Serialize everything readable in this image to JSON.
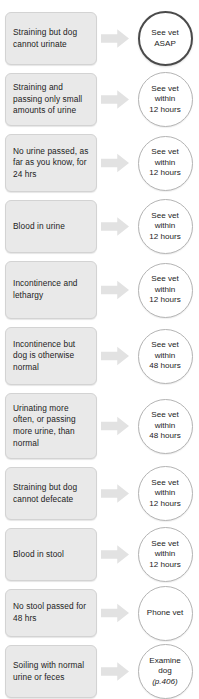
{
  "chart_data": {
    "type": "table",
    "columns": [
      "Symptom",
      "Action"
    ],
    "rows": [
      {
        "symptom": "Straining but dog cannot urinate",
        "action": "See vet ASAP",
        "urgency": "ASAP"
      },
      {
        "symptom": "Straining and passing only small amounts of urine",
        "action": "See vet within 12 hours",
        "urgency": "12 hours"
      },
      {
        "symptom": "No urine passed, as far as you know, for 24 hrs",
        "action": "See vet within 12 hours",
        "urgency": "12 hours"
      },
      {
        "symptom": "Blood in urine",
        "action": "See vet within 12 hours",
        "urgency": "12 hours"
      },
      {
        "symptom": "Incontinence and lethargy",
        "action": "See vet within 12 hours",
        "urgency": "12 hours"
      },
      {
        "symptom": "Incontinence but dog is otherwise normal",
        "action": "See vet within 48 hours",
        "urgency": "48 hours"
      },
      {
        "symptom": "Urinating more often, or passing more urine, than normal",
        "action": "See vet within 48 hours",
        "urgency": "48 hours"
      },
      {
        "symptom": "Straining but dog cannot defecate",
        "action": "See vet within 12 hours",
        "urgency": "12 hours"
      },
      {
        "symptom": "Blood in stool",
        "action": "See vet within 12 hours",
        "urgency": "12 hours"
      },
      {
        "symptom": "No stool passed for 48 hrs",
        "action": "Phone vet",
        "urgency": "phone"
      },
      {
        "symptom": "Soiling with normal urine or feces",
        "action": "Examine dog (p.406)",
        "urgency": "self-exam"
      }
    ]
  },
  "colors": {
    "box_fill": "#e9e9e9",
    "box_border": "#d3d3d3",
    "arrow_fill": "#e2e2e2",
    "circle_border": "#b4b4b4",
    "circle_border_emphasis": "#4a4a4a",
    "text": "#1c1c1c",
    "background": "#ffffff"
  },
  "rows": [
    {
      "symptom": "Straining but dog cannot urinate",
      "action_lines": [
        "See vet",
        "ASAP"
      ],
      "pageref": "",
      "emphasis": true
    },
    {
      "symptom": "Straining and passing only small amounts of urine",
      "action_lines": [
        "See vet",
        "within",
        "12 hours"
      ],
      "pageref": "",
      "emphasis": false
    },
    {
      "symptom": "No urine passed, as far as you know, for 24 hrs",
      "action_lines": [
        "See vet",
        "within",
        "12 hours"
      ],
      "pageref": "",
      "emphasis": false
    },
    {
      "symptom": "Blood in urine",
      "action_lines": [
        "See vet",
        "within",
        "12 hours"
      ],
      "pageref": "",
      "emphasis": false
    },
    {
      "symptom": "Incontinence and lethargy",
      "action_lines": [
        "See vet",
        "within",
        "12 hours"
      ],
      "pageref": "",
      "emphasis": false
    },
    {
      "symptom": "Incontinence but dog is otherwise normal",
      "action_lines": [
        "See vet",
        "within",
        "48 hours"
      ],
      "pageref": "",
      "emphasis": false
    },
    {
      "symptom": "Urinating more often, or passing more urine, than normal",
      "action_lines": [
        "See vet",
        "within",
        "48 hours"
      ],
      "pageref": "",
      "emphasis": false
    },
    {
      "symptom": "Straining but dog cannot defecate",
      "action_lines": [
        "See vet",
        "within",
        "12 hours"
      ],
      "pageref": "",
      "emphasis": false
    },
    {
      "symptom": "Blood in stool",
      "action_lines": [
        "See vet",
        "within",
        "12 hours"
      ],
      "pageref": "",
      "emphasis": false
    },
    {
      "symptom": "No stool passed for 48 hrs",
      "action_lines": [
        "Phone vet"
      ],
      "pageref": "",
      "emphasis": false
    },
    {
      "symptom": "Soiling with normal urine or feces",
      "action_lines": [
        "Examine",
        "dog"
      ],
      "pageref": "(p.406)",
      "emphasis": false
    }
  ]
}
